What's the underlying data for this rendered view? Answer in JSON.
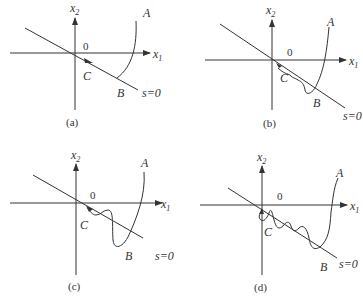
{
  "figure": {
    "panels": [
      {
        "id": "a",
        "caption": "(a)",
        "labels": {
          "x2": "x",
          "x2_sub": "2",
          "x1": "x",
          "x1_sub": "1",
          "origin": "0",
          "A": "A",
          "B": "B",
          "C": "C",
          "switch_line": "s=0"
        },
        "behavior": "ideal sliding: trajectory reaches line at B then slides smoothly along s=0 toward origin"
      },
      {
        "id": "b",
        "caption": "(b)",
        "labels": {
          "x2": "x",
          "x2_sub": "2",
          "x1": "x",
          "x1_sub": "1",
          "origin": "0",
          "A": "A",
          "B": "B",
          "C": "C",
          "switch_line": "s=0"
        },
        "behavior": "small chattering about s=0 along sliding phase"
      },
      {
        "id": "c",
        "caption": "(c)",
        "labels": {
          "x2": "x",
          "x2_sub": "2",
          "x1": "x",
          "x1_sub": "1",
          "origin": "0",
          "A": "A",
          "B": "B",
          "C": "C",
          "switch_line": "s=0"
        },
        "behavior": "larger overshoot oscillation crossing s=0"
      },
      {
        "id": "d",
        "caption": "(d)",
        "labels": {
          "x2": "x",
          "x2_sub": "2",
          "x1": "x",
          "x1_sub": "1",
          "origin": "0",
          "A": "A",
          "B": "B",
          "C": "C",
          "switch_line": "s=0"
        },
        "behavior": "multiple oscillations crossing s=0 before converging to origin"
      }
    ]
  }
}
